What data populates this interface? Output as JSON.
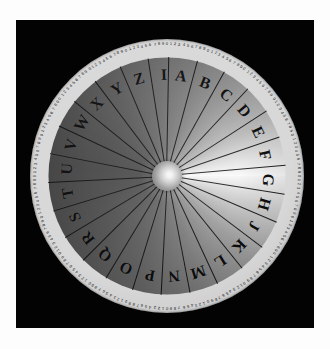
{
  "image": {
    "title": "Cipher disk / alphabet wheel",
    "plate_background": "#030303",
    "page_background": "#fdfdfd",
    "disk_diameter_px": 274,
    "center": {
      "x": 166,
      "y": 175
    }
  },
  "disk": {
    "sector_count": 26,
    "letters": [
      "A",
      "B",
      "C",
      "D",
      "E",
      "F",
      "G",
      "H",
      "J",
      "K",
      "L",
      "M",
      "N",
      "P",
      "O",
      "Q",
      "R",
      "S",
      "T",
      "U",
      "V",
      "W",
      "X",
      "Y",
      "Z",
      "I"
    ],
    "letter_order": "counter-clockwise",
    "alphabet_ring": {
      "label": "letter-ring",
      "letters_clockwise_from_top": [
        "Z",
        "A",
        "B",
        "C",
        "D",
        "E",
        "F",
        "G",
        "H",
        "J",
        "K",
        "L",
        "M",
        "N",
        "P",
        "O",
        "Q",
        "R",
        "S",
        "T",
        "U",
        "V",
        "W",
        "X",
        "Y",
        "I"
      ]
    },
    "hub": {
      "label": "center-hub",
      "color": "#8d8d8d"
    },
    "gradient": {
      "type": "conic",
      "brightest_direction": "east",
      "darkest_direction": "west-northwest",
      "light_hex": "#f7f7f7",
      "dark_hex": "#484848"
    },
    "outer_scale": {
      "label": "numbered-scale-ring",
      "digit_cycle": "0123456789",
      "total_ticks": 200,
      "ring_color": "#f2f2ef",
      "tick_color": "#141414"
    }
  },
  "sector_letters": [
    {
      "letter": "A",
      "angle_deg": -82
    },
    {
      "letter": "B",
      "angle_deg": -68
    },
    {
      "letter": "C",
      "angle_deg": -54
    },
    {
      "letter": "D",
      "angle_deg": -40
    },
    {
      "letter": "E",
      "angle_deg": -26
    },
    {
      "letter": "F",
      "angle_deg": -12
    },
    {
      "letter": "G",
      "angle_deg": 2
    },
    {
      "letter": "H",
      "angle_deg": 16
    },
    {
      "letter": "J",
      "angle_deg": 30
    },
    {
      "letter": "K",
      "angle_deg": 44
    },
    {
      "letter": "L",
      "angle_deg": 58
    },
    {
      "letter": "M",
      "angle_deg": 72
    },
    {
      "letter": "N",
      "angle_deg": 86
    },
    {
      "letter": "P",
      "angle_deg": 100
    },
    {
      "letter": "O",
      "angle_deg": 114
    },
    {
      "letter": "Q",
      "angle_deg": 128
    },
    {
      "letter": "R",
      "angle_deg": 142
    },
    {
      "letter": "S",
      "angle_deg": 156
    },
    {
      "letter": "T",
      "angle_deg": 170
    },
    {
      "letter": "U",
      "angle_deg": 184
    },
    {
      "letter": "V",
      "angle_deg": 198
    },
    {
      "letter": "W",
      "angle_deg": 212
    },
    {
      "letter": "X",
      "angle_deg": 226
    },
    {
      "letter": "Y",
      "angle_deg": 240
    },
    {
      "letter": "Z",
      "angle_deg": 254
    },
    {
      "letter": "I",
      "angle_deg": 268
    }
  ]
}
